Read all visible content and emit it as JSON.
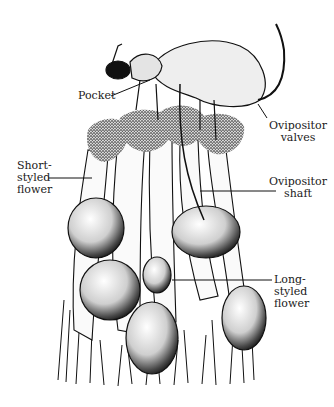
{
  "figure": {
    "labels": {
      "pocket": "Pocket",
      "ovipositor_valves": "Ovipositor\nvalves",
      "short_styled_flower": "Short-\nstyled\nflower",
      "ovipositor_shaft": "Ovipositor\nshaft",
      "long_styled_flower": "Long-\nstyled\nflower"
    },
    "colors": {
      "ink": "#111111",
      "background": "#ffffff",
      "stipple": "#3a3a3a"
    }
  }
}
